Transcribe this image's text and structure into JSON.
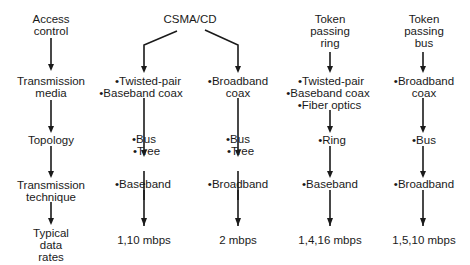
{
  "row_labels": {
    "access_control": [
      "Access",
      "control"
    ],
    "transmission_media": [
      "Transmission",
      "media"
    ],
    "topology": [
      "Topology"
    ],
    "transmission_technique": [
      "Transmission",
      "technique"
    ],
    "typical_data_rates": [
      "Typical",
      "data",
      "rates"
    ]
  },
  "columns": {
    "csma_cd": {
      "title": "CSMA/CD",
      "baseband_branch": {
        "media": [
          "•Twisted-pair",
          "•Baseband coax"
        ],
        "topology": [
          "•Bus",
          "•Tree"
        ],
        "technique": "•Baseband",
        "rate": "1,10 mbps"
      },
      "broadband_branch": {
        "media": [
          "•Broadband",
          "coax"
        ],
        "topology": [
          "•Bus",
          "•Tree"
        ],
        "technique": "•Broadband",
        "rate": "2 mbps"
      }
    },
    "token_ring": {
      "title": [
        "Token",
        "passing",
        "ring"
      ],
      "media": [
        "•Twisted-pair",
        "•Baseband coax",
        "•Fiber optics"
      ],
      "topology": "•Ring",
      "technique": "•Baseband",
      "rate": "1,4,16 mbps"
    },
    "token_bus": {
      "title": [
        "Token",
        "passing",
        "bus"
      ],
      "media": [
        "•Broadband",
        "coax"
      ],
      "topology": "•Bus",
      "technique": "•Broadband",
      "rate": "1,5,10 mbps"
    }
  },
  "colors": {
    "ink": "#1a1a1a",
    "background": "#ffffff"
  }
}
